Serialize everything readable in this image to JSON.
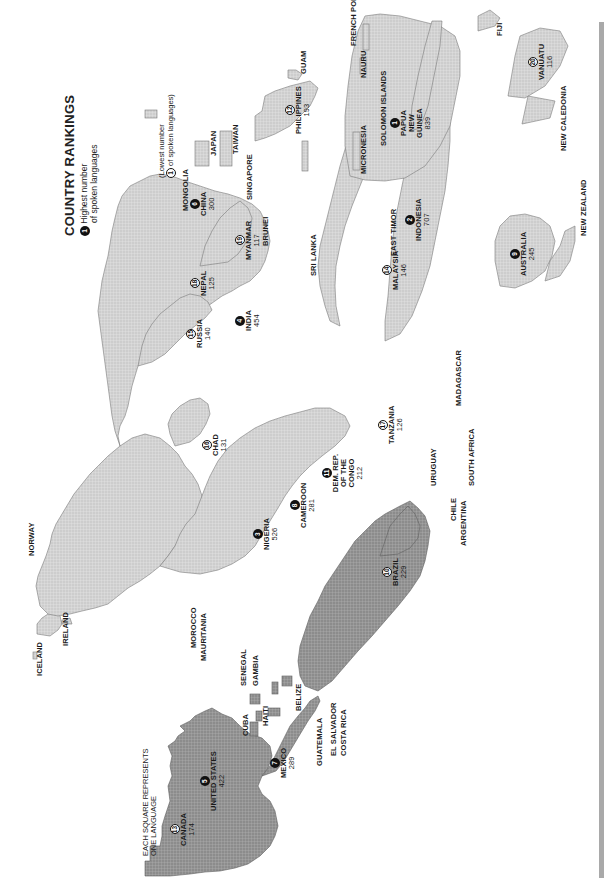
{
  "title": "COUNTRY RANKINGS",
  "legend": {
    "highest_marker": "1",
    "highest_text_line1": "Highest number",
    "highest_text_line2": "of spoken languages",
    "lowest_marker": "1",
    "lowest_text_line1": "(Lowest number",
    "lowest_text_line2": "of spoken languages)",
    "square_note_line1": "EACH SQUARE REPRESENTS",
    "square_note_line2": "ONE LANGUAGE"
  },
  "colors": {
    "americas": "#8a8a8a",
    "other_regions": "#c8c8c8",
    "borders": "#6e6e6e",
    "rank_badge": "#111111",
    "side_bar": "#a9a9a9",
    "background": "#ffffff"
  },
  "rankings": [
    {
      "rank": "1",
      "country": "PAPUA NEW GUINEA",
      "languages": "839"
    },
    {
      "rank": "2",
      "country": "INDONESIA",
      "languages": "707"
    },
    {
      "rank": "3",
      "country": "NIGERIA",
      "languages": "526"
    },
    {
      "rank": "4",
      "country": "INDIA",
      "languages": "454"
    },
    {
      "rank": "5",
      "country": "UNITED STATES",
      "languages": "422"
    },
    {
      "rank": "6",
      "country": "CHINA",
      "languages": "300"
    },
    {
      "rank": "7",
      "country": "MEXICO",
      "languages": "289"
    },
    {
      "rank": "8",
      "country": "CAMEROON",
      "languages": "281"
    },
    {
      "rank": "9",
      "country": "AUSTRALIA",
      "languages": "245"
    },
    {
      "rank": "10",
      "country": "BRAZIL",
      "languages": "229"
    },
    {
      "rank": "11",
      "country": "DEM. REP. OF THE CONGO",
      "languages": "212"
    },
    {
      "rank": "12",
      "country": "PHILIPPINES",
      "languages": "193"
    },
    {
      "rank": "13",
      "country": "CANADA",
      "languages": "174"
    },
    {
      "rank": "14",
      "country": "MALAYSIA",
      "languages": "146"
    },
    {
      "rank": "15",
      "country": "RUSSIA",
      "languages": "140"
    },
    {
      "rank": "16",
      "country": "CHAD",
      "languages": "131"
    },
    {
      "rank": "17",
      "country": "TANZANIA",
      "languages": "126"
    },
    {
      "rank": "18",
      "country": "NEPAL",
      "languages": "125"
    },
    {
      "rank": "19",
      "country": "MYANMAR",
      "languages": "117"
    },
    {
      "rank": "20",
      "country": "VANUATU",
      "languages": "116"
    }
  ],
  "labels": {
    "north_america": [
      "CANADA",
      "UNITED STATES",
      "MEXICO",
      "GUATEMALA",
      "EL SALVADOR",
      "COSTA RICA",
      "BELIZE",
      "HONDURAS",
      "NICARAGUA",
      "PANAMA",
      "CUBA",
      "HAITI",
      "PUERTO RICO",
      "DOMINICAN REPUBLIC",
      "JAMAICA",
      "TRINIDAD & TOBAGO"
    ],
    "south_america": [
      "VENE-ZUELA",
      "GUYANA",
      "SURINAME",
      "FRENCH GUIANA",
      "COLOMBIA",
      "ECUADOR",
      "PERU",
      "BOLIVIA",
      "PARAGUAY",
      "URUGUAY",
      "CHILE",
      "ARGENTINA",
      "BRAZIL"
    ],
    "europe": [
      "ICELAND",
      "IRELAND",
      "UNITED KINGDOM",
      "NORWAY",
      "SWEDEN",
      "FINLAND",
      "DENMARK",
      "NETHER-LANDS",
      "BELGIUM",
      "LUXEMBOURG",
      "SWITZERLAND",
      "FRANCE",
      "GER-MANY",
      "POLAND",
      "AUSTRIA",
      "ITALY",
      "ANDORRA",
      "PORTUGAL",
      "SPAIN",
      "SLOVENIA",
      "CROATIA",
      "BOSN. & HERZG.",
      "MONT.",
      "ALBANIA",
      "MACE.",
      "GREECE",
      "BULGARIA",
      "SERBIA",
      "ROMANIA",
      "MOLDOVA",
      "HUNGARY",
      "SLOVAKIA",
      "CZECH REP.",
      "BELARUS",
      "LITHUANIA",
      "LATVIA",
      "ESTONIA",
      "UKRAINE",
      "CYPRUS"
    ],
    "africa": [
      "MOROCCO",
      "MAURITANIA",
      "SENEGAL",
      "GAMBIA",
      "GUINEA-BISSAU",
      "GUINEA",
      "SIERRA LEONE",
      "LIBERIA",
      "CÔTE D'IVOIRE",
      "MALI",
      "BURKINA FASO",
      "GHANA",
      "TOGO",
      "BENIN",
      "NIGER",
      "ALGERIA",
      "TUNISIA",
      "LIBYA",
      "EGYPT",
      "SUDAN",
      "SOUTH SUDAN",
      "ERITREA",
      "ETHIOPIA",
      "DJIBOUTI",
      "SOMALIA",
      "KENYA",
      "UGANDA",
      "RWANDA",
      "BURUNDI",
      "CENTRAL AFRICAN REPUBLIC",
      "EQUATORIAL GUINEA",
      "GABON",
      "CONGO",
      "ANGOLA",
      "ZAMBIA",
      "MALAWI",
      "MOZAMBIQUE",
      "ZIMBABWE",
      "BOTSWANA",
      "NAMIBIA",
      "SOUTH AFRICA",
      "LESOTHO",
      "SWAZILAND",
      "MADAGASCAR",
      "COMOROS",
      "MAURITIUS",
      "RÉUNION"
    ],
    "asia": [
      "GEORGIA",
      "ARMENIA",
      "AZERBAIJAN",
      "TURKEY",
      "SYRIA",
      "LEBANON",
      "ISRAEL",
      "JORDAN",
      "IRAQ",
      "IRAN",
      "KUWAIT",
      "SAUDI ARABIA",
      "BAHRAIN",
      "QATAR",
      "U.A.E.",
      "OMAN",
      "YEMEN",
      "KAZAKHSTAN",
      "UZBEKISTAN",
      "TURKMEN-ISTAN",
      "AFGHAN-ISTAN",
      "KYRGYZSTAN",
      "TAJIKISTAN",
      "PAKISTAN",
      "NEPAL",
      "BHUTAN",
      "BANGLA-DESH",
      "SRI LANKA",
      "MONGOLIA",
      "NORTH KOREA",
      "SOUTH KOREA",
      "JAPAN",
      "TAIWAN",
      "LAOS",
      "THAILAND",
      "VIETNAM",
      "CAMBODIA",
      "SINGAPORE",
      "BRUNEI",
      "EAST TIMOR"
    ],
    "oceania": [
      "GUAM",
      "MICRONESIA",
      "NAURU",
      "SOLOMON ISLANDS",
      "FRENCH POLYNESIA",
      "FIJI",
      "NEW CALEDONIA",
      "NEW ZEALAND"
    ]
  }
}
